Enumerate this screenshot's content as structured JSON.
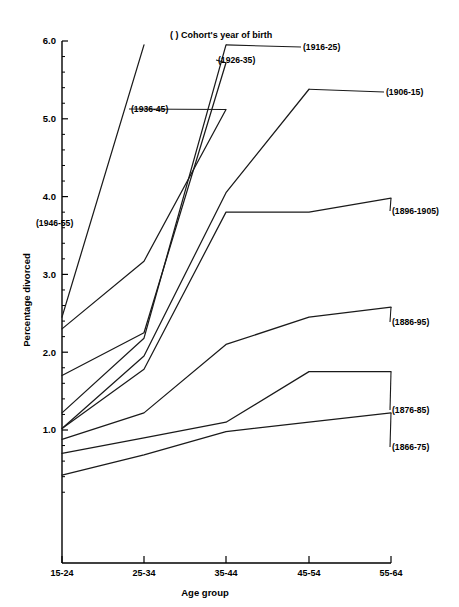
{
  "chart_data": {
    "type": "line",
    "title": "( ) Cohort's year of birth",
    "xlabel": "Age group",
    "ylabel": "Percentage divorced",
    "categories": [
      "15-24",
      "25-34",
      "35-44",
      "45-54",
      "55-64"
    ],
    "ylim": [
      0.0,
      6.0
    ],
    "ytick_labels": [
      "6.0",
      "5.0",
      "4.0",
      "3.0",
      "2.0",
      "1.0"
    ],
    "ytick_values": [
      6.0,
      5.0,
      4.0,
      3.0,
      2.0,
      1.0
    ],
    "minor_ticks": true,
    "grid": false,
    "legend": "inline-end-labels",
    "series": [
      {
        "name": "(1946-55)",
        "label": "(1946-55)",
        "x": [
          "15-24",
          "25-34"
        ],
        "values": [
          2.45,
          5.95
        ]
      },
      {
        "name": "(1936-45)",
        "label": "(1936-45)",
        "x": [
          "15-24",
          "25-34",
          "35-44"
        ],
        "values": [
          2.3,
          3.17,
          5.12
        ]
      },
      {
        "name": "(1926-35)",
        "label": "(1926-35)",
        "x": [
          "15-24",
          "25-34",
          "35-44"
        ],
        "values": [
          1.7,
          2.25,
          5.72
        ]
      },
      {
        "name": "(1916-25)",
        "label": "(1916-25)",
        "x": [
          "15-24",
          "25-34",
          "35-44"
        ],
        "values": [
          1.22,
          2.18,
          5.95
        ]
      },
      {
        "name": "(1906-15)",
        "label": "(1906-15)",
        "x": [
          "15-24",
          "25-34",
          "35-44",
          "45-54"
        ],
        "values": [
          1.02,
          1.95,
          4.05,
          5.38
        ]
      },
      {
        "name": "(1896-1905)",
        "label": "(1896-1905)",
        "x": [
          "15-24",
          "25-34",
          "35-44",
          "45-54",
          "55-64"
        ],
        "values": [
          1.02,
          1.78,
          3.8,
          3.8,
          3.98
        ]
      },
      {
        "name": "(1886-95)",
        "label": "(1886-95)",
        "x": [
          "15-24",
          "25-34",
          "35-44",
          "45-54",
          "55-64"
        ],
        "values": [
          0.88,
          1.22,
          2.1,
          2.45,
          2.58
        ]
      },
      {
        "name": "(1876-85)",
        "label": "(1876-85)",
        "x": [
          "15-24",
          "25-34",
          "35-44",
          "45-54",
          "55-64"
        ],
        "values": [
          0.7,
          0.9,
          1.1,
          1.75,
          1.75
        ]
      },
      {
        "name": "(1866-75)",
        "label": "(1866-75)",
        "x": [
          "15-24",
          "25-34",
          "35-44",
          "45-54",
          "55-64"
        ],
        "values": [
          0.42,
          0.68,
          0.98,
          1.1,
          1.22
        ]
      }
    ]
  },
  "colors": {
    "line": "#1a1a1a",
    "axis": "#000000",
    "background": "#ffffff"
  }
}
